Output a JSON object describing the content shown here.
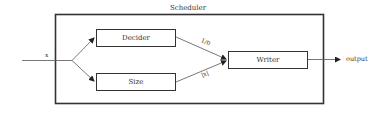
{
  "diagram": {
    "container": {
      "label": "Scheduler"
    },
    "input": {
      "label": "x"
    },
    "blocks": [
      {
        "id": "decider",
        "label": "Decider"
      },
      {
        "id": "size",
        "label": "Size"
      },
      {
        "id": "writer",
        "label": "Writer"
      }
    ],
    "edges": [
      {
        "from": "input",
        "to": "decider",
        "label": ""
      },
      {
        "from": "input",
        "to": "size",
        "label": ""
      },
      {
        "from": "decider",
        "to": "writer",
        "label": "1/0"
      },
      {
        "from": "size",
        "to": "writer",
        "label": "|x|"
      },
      {
        "from": "writer",
        "to": "output",
        "label": ""
      }
    ],
    "output": {
      "label": "output"
    }
  }
}
